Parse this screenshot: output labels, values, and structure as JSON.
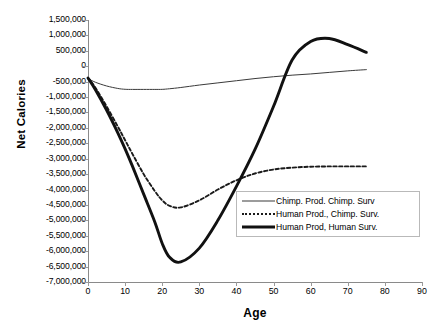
{
  "chart_data": {
    "type": "line",
    "title": "",
    "xlabel": "Age",
    "ylabel": "Net Calories",
    "xlim": [
      0,
      90
    ],
    "ylim": [
      -7000000,
      1500000
    ],
    "xticks": [
      0,
      10,
      20,
      30,
      40,
      50,
      60,
      70,
      80,
      90
    ],
    "xtick_labels": [
      "0",
      "10",
      "20",
      "30",
      "40",
      "50",
      "60",
      "70",
      "80",
      "90"
    ],
    "yticks": [
      1500000,
      1000000,
      500000,
      0,
      -500000,
      -1000000,
      -1500000,
      -2000000,
      -2500000,
      -3000000,
      -3500000,
      -4000000,
      -4500000,
      -5000000,
      -5500000,
      -6000000,
      -6500000,
      -7000000
    ],
    "ytick_labels": [
      "1,500,000",
      "1,000,000",
      "500,000",
      "0",
      "-500,000",
      "-1,000,000",
      "-1,500,000",
      "-2,000,000",
      "-2,500,000",
      "-3,000,000",
      "-3,500,000",
      "-4,000,000",
      "-4,500,000",
      "-5,000,000",
      "-5,500,000",
      "-6,000,000",
      "-6,500,000",
      "-7,000,000"
    ],
    "grid": false,
    "legend_position": "lower-right-inside",
    "series": [
      {
        "name": "Chimp. Prod. Chimp. Surv",
        "style": "thin-solid",
        "color": "#3a3a3a",
        "x": [
          0,
          2,
          5,
          8,
          10,
          12,
          15,
          18,
          20,
          22,
          25,
          30,
          35,
          40,
          45,
          50,
          55,
          60,
          65,
          70,
          75
        ],
        "y": [
          -400000,
          -520000,
          -640000,
          -720000,
          -748000,
          -752000,
          -752000,
          -752000,
          -750000,
          -730000,
          -690000,
          -610000,
          -540000,
          -470000,
          -400000,
          -340000,
          -290000,
          -250000,
          -200000,
          -150000,
          -110000
        ]
      },
      {
        "name": "Human Prod., Chimp. Surv.",
        "style": "dashed",
        "color": "#1a1a1a",
        "x": [
          0,
          2,
          5,
          8,
          10,
          12,
          15,
          18,
          20,
          22,
          25,
          30,
          35,
          40,
          45,
          50,
          55,
          60,
          65,
          70,
          75
        ],
        "y": [
          -380000,
          -700000,
          -1300000,
          -1950000,
          -2400000,
          -2850000,
          -3500000,
          -4050000,
          -4350000,
          -4530000,
          -4580000,
          -4350000,
          -4000000,
          -3700000,
          -3480000,
          -3350000,
          -3290000,
          -3260000,
          -3250000,
          -3250000,
          -3250000
        ]
      },
      {
        "name": "Human Prod, Human Surv.",
        "style": "thick-solid",
        "color": "#111111",
        "x": [
          0,
          2,
          5,
          8,
          10,
          12,
          15,
          18,
          20,
          22,
          25,
          30,
          35,
          40,
          45,
          50,
          55,
          60,
          65,
          70,
          75
        ],
        "y": [
          -380000,
          -760000,
          -1420000,
          -2150000,
          -2680000,
          -3250000,
          -4150000,
          -5050000,
          -5750000,
          -6200000,
          -6350000,
          -5900000,
          -5000000,
          -3900000,
          -2700000,
          -1300000,
          200000,
          800000,
          900000,
          700000,
          450000
        ]
      }
    ]
  },
  "legend": {
    "items": [
      {
        "label": "Chimp. Prod. Chimp. Surv",
        "key": "thin-solid"
      },
      {
        "label": "Human Prod., Chimp. Surv.",
        "key": "dashed"
      },
      {
        "label": "Human Prod, Human Surv.",
        "key": "thick-solid"
      }
    ]
  }
}
